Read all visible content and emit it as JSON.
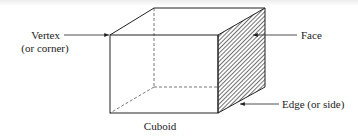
{
  "diagram": {
    "title": "Cuboid",
    "labels": {
      "vertex_line1": "Vertex",
      "vertex_line2": "(or corner)",
      "face": "Face",
      "edge": "Edge (or side)"
    },
    "colors": {
      "line": "#222222",
      "hatch": "#333333",
      "background": "#ffffff"
    }
  }
}
